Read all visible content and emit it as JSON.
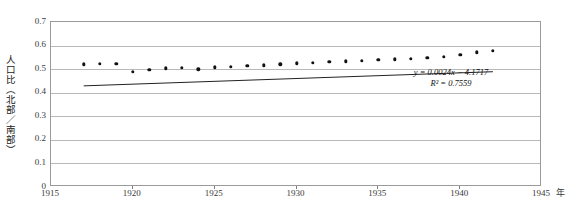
{
  "chart_data": {
    "type": "scatter",
    "title": "第2図　北部／南部人口比の推移",
    "xlabel": "年",
    "ylabel": "人口比（北部／南部）",
    "xlim": [
      1915,
      1945
    ],
    "ylim": [
      0,
      0.7
    ],
    "xticks": [
      1915,
      1920,
      1925,
      1930,
      1935,
      1940,
      1945
    ],
    "xtick_labels": [
      "1915",
      "1920",
      "1925",
      "1930",
      "1935",
      "1940",
      "1945"
    ],
    "x_unit_label": "年",
    "yticks": [
      0,
      0.1,
      0.2,
      0.3,
      0.4,
      0.5,
      0.6,
      0.7
    ],
    "ytick_labels": [
      "0",
      "0.1",
      "0.2",
      "0.3",
      "0.4",
      "0.5",
      "0.6",
      "0.7"
    ],
    "grid": "horizontal",
    "legend": "none",
    "marker": "diamond-filled-black",
    "series": [
      {
        "name": "人口比（北部／南部）",
        "x": [
          1917,
          1918,
          1919,
          1920,
          1921,
          1922,
          1923,
          1924,
          1925,
          1926,
          1927,
          1928,
          1929,
          1930,
          1931,
          1932,
          1933,
          1934,
          1935,
          1936,
          1937,
          1938,
          1939,
          1940,
          1941,
          1942
        ],
        "values": [
          0.521,
          0.522,
          0.523,
          0.49,
          0.497,
          0.503,
          0.506,
          0.5,
          0.507,
          0.511,
          0.514,
          0.517,
          0.52,
          0.524,
          0.527,
          0.53,
          0.533,
          0.536,
          0.539,
          0.542,
          0.545,
          0.549,
          0.553,
          0.562,
          0.572,
          0.578
        ]
      }
    ],
    "trendline": {
      "equation": "y = 0.0024x − 4.1717",
      "r_squared": "R² = 0.7559",
      "slope": 0.0024,
      "intercept": -4.1717,
      "r2_value": 0.7559,
      "x_start": 1917,
      "x_end": 1942,
      "y_start": 0.4291,
      "y_end": 0.4891
    }
  }
}
